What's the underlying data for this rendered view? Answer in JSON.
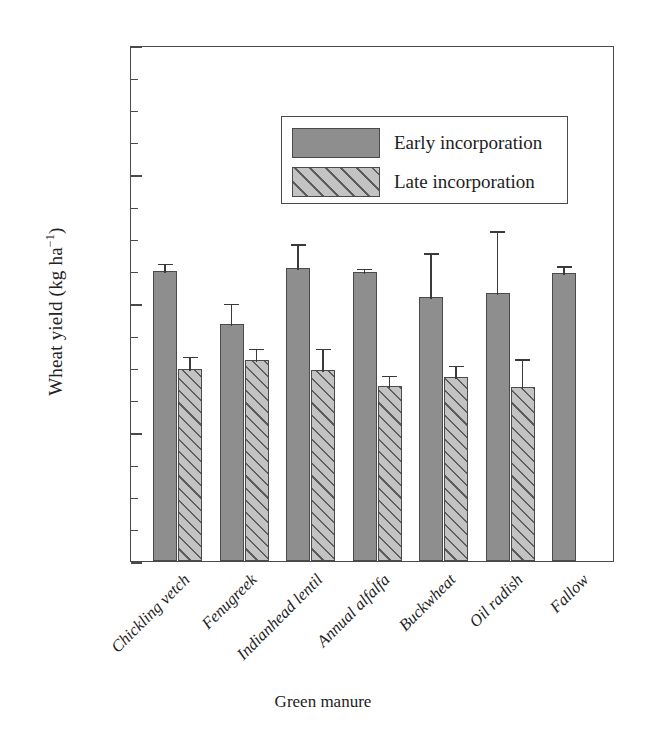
{
  "chart_data": {
    "type": "bar",
    "title": "",
    "xlabel": "Green manure",
    "ylabel": "Wheat yield (kg ha⁻¹)",
    "ylim": [
      0,
      4000
    ],
    "ytick_labels": [
      "0",
      "1000",
      "2000",
      "3000",
      "4000"
    ],
    "ytick_values": [
      0,
      1000,
      2000,
      3000,
      4000
    ],
    "yminor_step": 250,
    "grid": false,
    "legend_position": "upper-left-inside",
    "categories": [
      "Chickling vetch",
      "Fenugreek",
      "Indianhead lentil",
      "Annual alfalfa",
      "Buckwheat",
      "Oil radish",
      "Fallow"
    ],
    "series": [
      {
        "name": "Early incorporation",
        "fill": "solid-gray",
        "color": "#8e8e8e",
        "values": [
          2250,
          1840,
          2270,
          2240,
          2050,
          2080,
          2230
        ],
        "errors": [
          70,
          170,
          200,
          40,
          350,
          490,
          70
        ]
      },
      {
        "name": "Late incorporation",
        "fill": "diagonal-hatch",
        "color": "#c3c3c3",
        "values": [
          1490,
          1560,
          1480,
          1360,
          1430,
          1350,
          null
        ],
        "errors": [
          110,
          100,
          180,
          90,
          100,
          230,
          null
        ]
      }
    ]
  },
  "legend": {
    "items": [
      {
        "label": "Early incorporation",
        "style": "early"
      },
      {
        "label": "Late incorporation",
        "style": "late"
      }
    ]
  },
  "axis": {
    "y_title_main": "Wheat yield (kg ha",
    "y_title_exp": "−1",
    "y_title_tail": ")",
    "x_title": "Green manure"
  }
}
